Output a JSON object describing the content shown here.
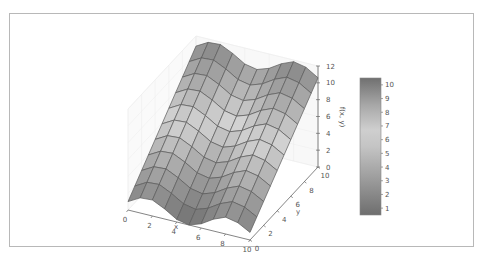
{
  "chart_data": {
    "type": "surface3d",
    "title": "",
    "function_description": "f(x, y) surface: rises linearly with y, sinusoidal along x",
    "xlabel": "x",
    "ylabel": "y",
    "zlabel": "f(x, y)",
    "xlim": [
      0,
      10
    ],
    "ylim": [
      0,
      10
    ],
    "zlim": [
      0,
      12
    ],
    "x_ticks": [
      "0",
      "2",
      "4",
      "6",
      "8",
      "10"
    ],
    "y_ticks": [
      "0",
      "2",
      "4",
      "6",
      "8",
      "10"
    ],
    "z_ticks": [
      "0",
      "2",
      "4",
      "6",
      "8",
      "10",
      "12"
    ],
    "grid_resolution": 11,
    "z_samples_front_edge_y0": [
      1.0,
      1.8,
      1.9,
      1.2,
      0.3,
      0.0,
      0.5,
      1.4,
      2.0,
      1.7,
      0.9
    ],
    "z_samples_back_edge_y10": [
      10.8,
      11.6,
      11.7,
      11.0,
      10.1,
      9.8,
      10.3,
      11.2,
      11.8,
      11.5,
      10.6
    ],
    "colormap": "grayscale (dark at extremes, light in middle)",
    "colorbar": {
      "ticks": [
        "1",
        "2",
        "3",
        "4",
        "5",
        "6",
        "7",
        "8",
        "9",
        "10"
      ],
      "range": [
        0.5,
        10.5
      ]
    },
    "grid": true,
    "legend": "none"
  }
}
